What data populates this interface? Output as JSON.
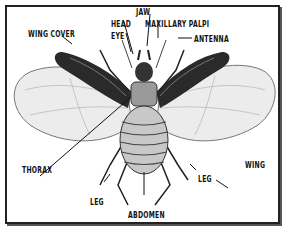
{
  "diagram": {
    "labels": {
      "jaw": "JAW",
      "head": "HEAD",
      "maxillary_palpi": "MAXILLARY PALPI",
      "eye": "EYE",
      "wing_cover": "WING COVER",
      "antenna": "ANTENNA",
      "thorax": "THORAX",
      "wing": "WING",
      "leg_left": "LEG",
      "leg_right": "LEG",
      "abdomen": "ABDOMEN"
    },
    "colors": {
      "ink": "#111111",
      "wing_cover": "#2a2a2a",
      "wing": "#e6e6e6",
      "body": "#bdbdbd",
      "background": "#ffffff"
    }
  }
}
